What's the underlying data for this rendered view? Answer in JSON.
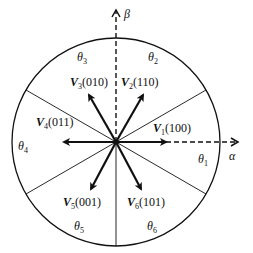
{
  "diagram": {
    "axes": {
      "alpha": {
        "label": "α"
      },
      "beta": {
        "label": "β"
      }
    },
    "vectors": [
      {
        "name": "V",
        "sub": "1",
        "state": "(100)",
        "angle_deg": 0
      },
      {
        "name": "V",
        "sub": "2",
        "state": "(110)",
        "angle_deg": 60
      },
      {
        "name": "V",
        "sub": "3",
        "state": "(010)",
        "angle_deg": 120
      },
      {
        "name": "V",
        "sub": "4",
        "state": "(011)",
        "angle_deg": 180
      },
      {
        "name": "V",
        "sub": "5",
        "state": "(001)",
        "angle_deg": 240
      },
      {
        "name": "V",
        "sub": "6",
        "state": "(101)",
        "angle_deg": 300
      }
    ],
    "sectors": [
      {
        "name": "θ",
        "sub": "1"
      },
      {
        "name": "θ",
        "sub": "2"
      },
      {
        "name": "θ",
        "sub": "3"
      },
      {
        "name": "θ",
        "sub": "4"
      },
      {
        "name": "θ",
        "sub": "5"
      },
      {
        "name": "θ",
        "sub": "6"
      }
    ],
    "colors": {
      "stroke": "#111111",
      "background": "#ffffff"
    }
  }
}
